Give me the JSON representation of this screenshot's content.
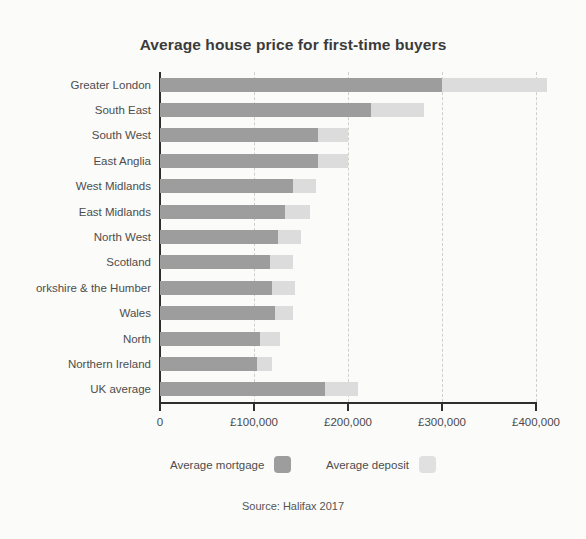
{
  "chart_data": {
    "type": "bar",
    "orientation": "horizontal",
    "stacked": true,
    "title": "Average house price for first-time buyers",
    "subtitle": "",
    "xlabel": "",
    "ylabel": "",
    "xlim": [
      0,
      400000
    ],
    "grid": true,
    "grid_axis": "x",
    "legend_position": "bottom",
    "source": "Source: Halifax 2017",
    "tick_labels": [
      "0",
      "£100,000",
      "£200,000",
      "£300,000",
      "£400,000"
    ],
    "tick_values": [
      0,
      100000,
      200000,
      300000,
      400000
    ],
    "categories": [
      "Greater London",
      "South East",
      "South West",
      "East Anglia",
      "West Midlands",
      "East Midlands",
      "North West",
      "Scotland",
      "orkshire & the Humber",
      "Wales",
      "North",
      "Northern Ireland",
      "UK average"
    ],
    "series": [
      {
        "name": "Average mortgage",
        "color": "#9d9d9d",
        "values": [
          300000,
          224000,
          168000,
          168000,
          141000,
          133000,
          125000,
          117000,
          119000,
          122000,
          106000,
          103000,
          175000
        ]
      },
      {
        "name": "Average deposit",
        "color": "#dcdcdc",
        "values": [
          112000,
          57000,
          32000,
          32000,
          25000,
          27000,
          25000,
          24000,
          25000,
          19000,
          22000,
          16000,
          36000
        ]
      }
    ],
    "totals": [
      412000,
      281000,
      200000,
      200000,
      166000,
      160000,
      150000,
      141000,
      144000,
      141000,
      128000,
      119000,
      211000
    ]
  },
  "legend": {
    "items": [
      {
        "label": "Average mortgage",
        "color": "#9d9d9d"
      },
      {
        "label": "Average deposit",
        "color": "#e0e0e0"
      }
    ]
  }
}
